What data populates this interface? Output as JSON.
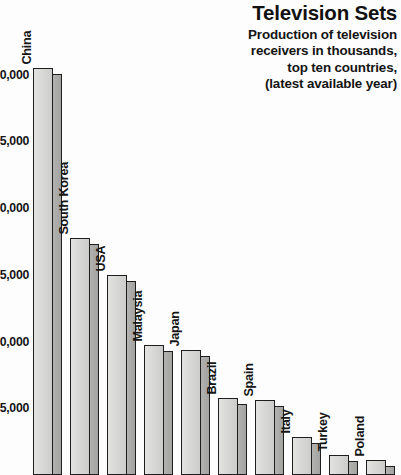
{
  "header": {
    "title": "Television Sets",
    "subtitle_lines": [
      "Production of television",
      "receivers in thousands,",
      "top ten countries,",
      "(latest available year)"
    ]
  },
  "colors": {
    "bar_front": "#d9d9d7",
    "bar_side": "#a8a8a6",
    "outline": "#1e1e1e",
    "text": "#151515",
    "background": "#fdfdfd"
  },
  "chart_data": {
    "type": "bar",
    "title": "Television Sets",
    "subtitle": "Production of television receivers in thousands, top ten countries, (latest available year)",
    "xlabel": "",
    "ylabel": "",
    "ylim": [
      0,
      32500
    ],
    "grid": false,
    "legend": "none",
    "axis_note": "y tick labels are clipped at the left edge of the image; leading digits partially cut off",
    "yticks": [
      30000,
      25000,
      20000,
      15000,
      10000,
      5000
    ],
    "ytick_labels": [
      "0,000",
      "5,000",
      "0,000",
      "5,000",
      "0,000",
      "5,000"
    ],
    "ytick_labels_full": [
      "30,000",
      "25,000",
      "20,000",
      "15,000",
      "10,000",
      "5,000"
    ],
    "categories": [
      "China",
      "South Korea",
      "USA",
      "Malaysia",
      "Japan",
      "Brazil",
      "Spain",
      "Italy",
      "Turkey",
      "Poland"
    ],
    "values": [
      30500,
      17800,
      13800,
      8700,
      8500,
      5200,
      5100,
      2700,
      1450,
      1100
    ],
    "units": "thousands of units"
  },
  "bars": [
    {
      "label": "China",
      "value": 30500,
      "top_px": 68,
      "x_px": 2
    },
    {
      "label": "South Korea",
      "value": 17800,
      "top_px": 238,
      "x_px": 39
    },
    {
      "label": "USA",
      "value": 13800,
      "top_px": 275,
      "x_px": 76
    },
    {
      "label": "Malaysia",
      "value": 8700,
      "top_px": 345,
      "x_px": 113
    },
    {
      "label": "Japan",
      "value": 8500,
      "top_px": 350,
      "x_px": 150
    },
    {
      "label": "Brazil",
      "value": 5200,
      "top_px": 398,
      "x_px": 187
    },
    {
      "label": "Spain",
      "value": 5100,
      "top_px": 400,
      "x_px": 224
    },
    {
      "label": "Italy",
      "value": 2700,
      "top_px": 437,
      "x_px": 261
    },
    {
      "label": "Turkey",
      "value": 1450,
      "top_px": 455,
      "x_px": 298
    },
    {
      "label": "Poland",
      "value": 1100,
      "top_px": 460,
      "x_px": 335
    }
  ]
}
